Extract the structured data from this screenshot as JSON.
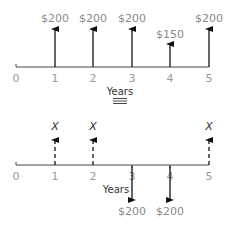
{
  "diagram": {
    "top": {
      "axis_label": "Years",
      "ticks": [
        "0",
        "1",
        "2",
        "3",
        "4",
        "5"
      ],
      "arrows": [
        {
          "year": "1",
          "label": "$200",
          "direction": "up"
        },
        {
          "year": "2",
          "label": "$200",
          "direction": "up"
        },
        {
          "year": "3",
          "label": "$200",
          "direction": "up"
        },
        {
          "year": "4",
          "label": "$150",
          "direction": "up"
        },
        {
          "year": "5",
          "label": "$200",
          "direction": "up"
        }
      ]
    },
    "equivalence_symbol": "≡",
    "bottom": {
      "axis_label": "Years",
      "ticks": [
        "0",
        "1",
        "2",
        "3",
        "4",
        "5"
      ],
      "arrows": [
        {
          "year": "1",
          "label": "X",
          "direction": "up",
          "style": "dashed"
        },
        {
          "year": "2",
          "label": "X",
          "direction": "up",
          "style": "dashed"
        },
        {
          "year": "3",
          "label": "$200",
          "direction": "down",
          "style": "solid"
        },
        {
          "year": "4",
          "label": "$200",
          "direction": "down",
          "style": "solid"
        },
        {
          "year": "5",
          "label": "X",
          "direction": "up",
          "style": "dashed"
        }
      ]
    }
  }
}
